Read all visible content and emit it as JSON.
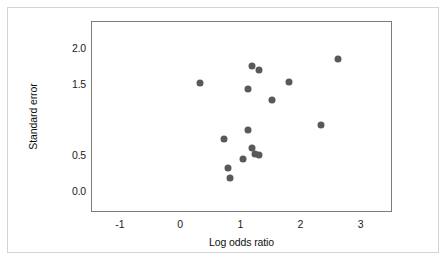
{
  "chart_data": {
    "type": "scatter",
    "title": "",
    "xlabel": "Log odds ratio",
    "ylabel": "Standard error",
    "xlim": [
      -1.48,
      3.52
    ],
    "ylim": [
      2.38,
      -0.3
    ],
    "y_inverted": true,
    "grid": false,
    "legend": null,
    "xticks": [
      "-1",
      "0",
      "1",
      "2",
      "3"
    ],
    "xtick_values": [
      -1,
      0,
      1,
      2,
      3
    ],
    "yticks": [
      "0.0",
      "0.5",
      "1.5",
      "2.0"
    ],
    "ytick_values": [
      0.0,
      0.5,
      1.5,
      2.0
    ],
    "marker": {
      "shape": "circle",
      "color": "#595959",
      "size_px": 7
    },
    "points": [
      {
        "x": 0.31,
        "y": 1.53
      },
      {
        "x": 0.81,
        "y": 0.19
      },
      {
        "x": 0.78,
        "y": 0.33
      },
      {
        "x": 0.71,
        "y": 0.74
      },
      {
        "x": 1.03,
        "y": 0.46
      },
      {
        "x": 1.18,
        "y": 0.61
      },
      {
        "x": 1.23,
        "y": 0.53
      },
      {
        "x": 1.29,
        "y": 0.51
      },
      {
        "x": 1.11,
        "y": 0.86
      },
      {
        "x": 1.11,
        "y": 1.44
      },
      {
        "x": 1.18,
        "y": 1.76
      },
      {
        "x": 1.51,
        "y": 1.29
      },
      {
        "x": 1.29,
        "y": 1.7
      },
      {
        "x": 1.79,
        "y": 1.54
      },
      {
        "x": 2.32,
        "y": 0.93
      },
      {
        "x": 2.6,
        "y": 1.86
      }
    ]
  }
}
